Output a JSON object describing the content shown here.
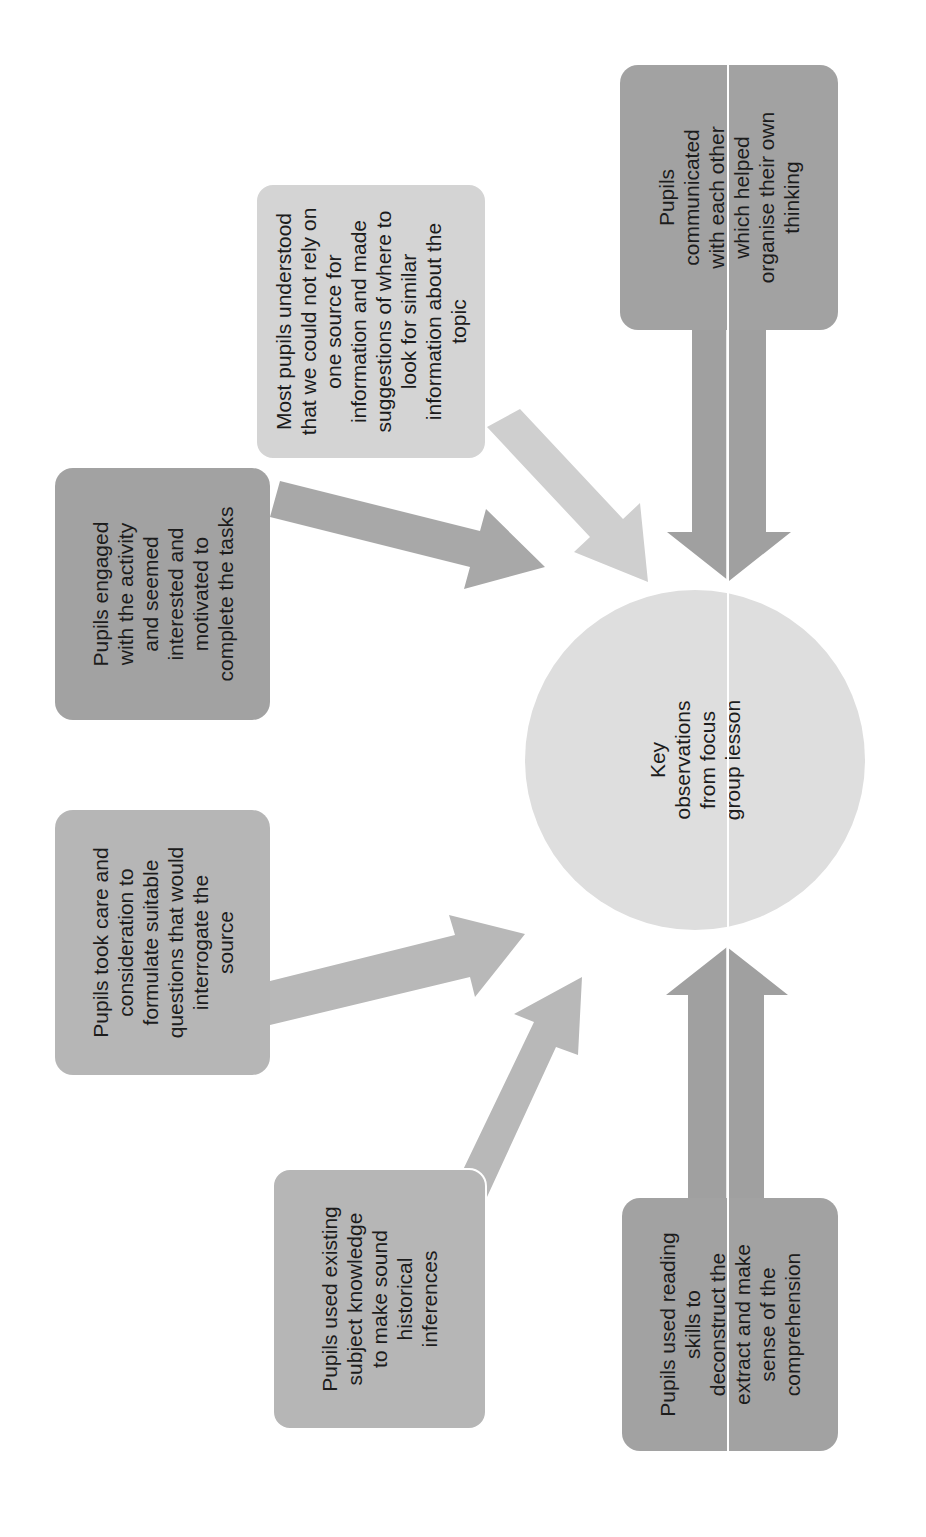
{
  "diagram": {
    "title": "Key observations from focus group lesson",
    "hub": {
      "label": "Key\nobservations\nfrom focus\ngroup lesson",
      "color": "#dedede"
    },
    "nodes": [
      {
        "id": "communicated",
        "label": "Pupils\ncommunicated\nwith each other\nwhich helped\norganise their own\nthinking",
        "shade": "dark"
      },
      {
        "id": "sources",
        "label": "Most pupils understood\nthat we could not rely on\none source for\ninformation and made\nsuggestions of where to\nlook for similar\ninformation about the\ntopic",
        "shade": "light"
      },
      {
        "id": "engaged",
        "label": "Pupils engaged\nwith the activity\nand seemed\ninterested and\nmotivated to\ncomplete the tasks",
        "shade": "dark"
      },
      {
        "id": "questions",
        "label": "Pupils took care and\nconsideration to\nformulate suitable\nquestions that would\ninterrogate the\nsource",
        "shade": "mid"
      },
      {
        "id": "knowledge",
        "label": "Pupils used existing\nsubject knowledge\nto make sound\nhistorical\ninferences",
        "shade": "mid"
      },
      {
        "id": "reading",
        "label": "Pupils used reading\nskills to\ndeconstruct the\nextract and make\nsense of the\ncomprehension",
        "shade": "dark"
      }
    ],
    "colors": {
      "dark": "#a2a2a2",
      "mid": "#b6b6b6",
      "light": "#d4d4d4",
      "arrow_dark": "#a0a0a0",
      "arrow_mid": "#b4b4b4",
      "arrow_light": "#cfcfcf"
    },
    "orientation": "rotated 90° counter-clockwise"
  }
}
